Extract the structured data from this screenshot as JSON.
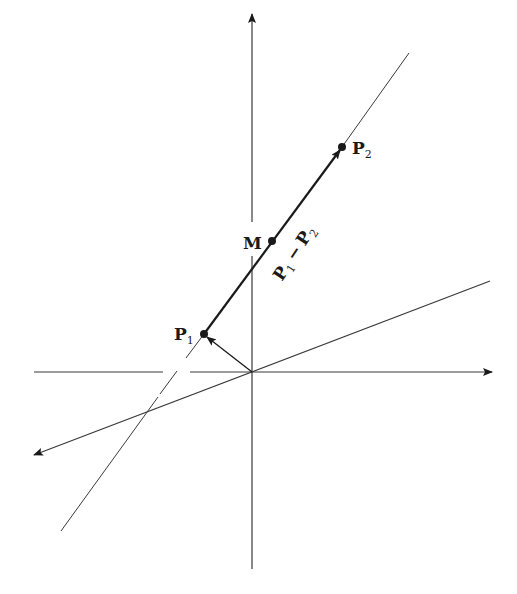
{
  "figure": {
    "type": "vector-line-diagram",
    "colors": {
      "ink": "#1a1a1a",
      "thin_line": "#3a3a3a",
      "background": "#ffffff"
    }
  },
  "axes": {
    "origin": [
      252,
      372
    ],
    "horizontal": {
      "from": [
        34,
        372
      ],
      "to": [
        492,
        372
      ],
      "arrow": "right",
      "gap": [
        163,
        190
      ]
    },
    "vertical": {
      "from": [
        252,
        569
      ],
      "to": [
        252,
        14
      ],
      "arrow": "up",
      "gap": [
        222,
        256
      ]
    },
    "slanted": {
      "from": [
        490,
        281
      ],
      "to": [
        34,
        455
      ],
      "arrow": "lower-left"
    }
  },
  "lines": {
    "line_through_points": {
      "from": [
        61,
        531
      ],
      "to": [
        409,
        53
      ],
      "gaps": [
        [
          148,
          393,
          160,
          405
        ],
        [
          175,
          355,
          186,
          388
        ]
      ]
    },
    "segment_P1_P2": {
      "from": [
        204,
        334
      ],
      "to": [
        342,
        147
      ],
      "arrow_at": "P2"
    },
    "origin_to_P1": {
      "from": [
        252,
        372
      ],
      "to": [
        204,
        334
      ],
      "arrow_at": "P1"
    }
  },
  "points": [
    {
      "id": "P1",
      "label": "P",
      "subscript": "1",
      "pos": [
        204,
        334
      ],
      "label_pos": [
        174,
        340
      ]
    },
    {
      "id": "M",
      "label": "M",
      "subscript": "",
      "pos": [
        272,
        241
      ],
      "label_pos": [
        243,
        249
      ]
    },
    {
      "id": "P2",
      "label": "P",
      "subscript": "2",
      "pos": [
        342,
        147
      ],
      "label_pos": [
        352,
        154
      ]
    }
  ],
  "annotations": {
    "segment_label": {
      "text_a": "P",
      "sub_a": "1",
      "dash": "−",
      "text_b": "P",
      "sub_b": "2",
      "pos": [
        282,
        272
      ],
      "rotate": -57
    }
  }
}
